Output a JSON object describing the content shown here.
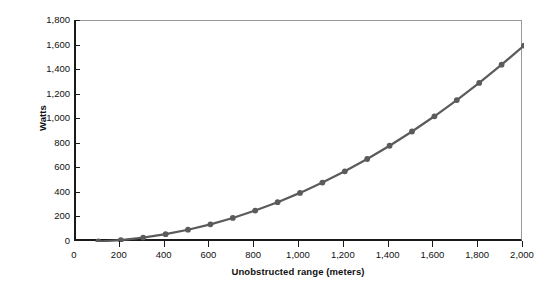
{
  "chart_data": {
    "type": "line",
    "title": "",
    "xlabel": "Unobstructed range (meters)",
    "ylabel": "Watts",
    "xlim": [
      0,
      2000
    ],
    "ylim": [
      0,
      1800
    ],
    "grid": false,
    "legend": "none",
    "marker": "circle",
    "series_color": "#5b5b5b",
    "axis_color": "#1a1a1a",
    "frame_color": "#9a9a9a",
    "background": "#ffffff",
    "xticks": [
      0,
      200,
      400,
      600,
      800,
      1000,
      1200,
      1400,
      1600,
      1800,
      2000
    ],
    "xtick_labels": [
      "0",
      "200",
      "400",
      "600",
      "800",
      "1,000",
      "1,200",
      "1,400",
      "1,600",
      "1,800",
      "2,000"
    ],
    "yticks": [
      0,
      200,
      400,
      600,
      800,
      1000,
      1200,
      1400,
      1600,
      1800
    ],
    "ytick_labels": [
      "0",
      "200",
      "400",
      "600",
      "800",
      "1,000",
      "1,200",
      "1,400",
      "1,600",
      "1,800"
    ],
    "x": [
      100,
      200,
      300,
      400,
      500,
      600,
      700,
      800,
      900,
      1000,
      1100,
      1200,
      1300,
      1400,
      1500,
      1600,
      1700,
      1800,
      1900,
      2000
    ],
    "values": [
      4,
      16,
      36,
      64,
      100,
      144,
      196,
      256,
      324,
      400,
      484,
      576,
      676,
      784,
      900,
      1024,
      1156,
      1296,
      1444,
      1600
    ]
  }
}
